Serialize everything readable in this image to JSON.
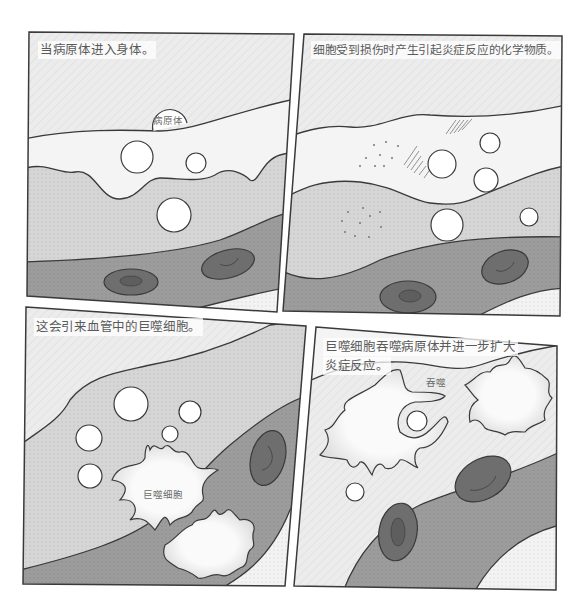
{
  "comic": {
    "panels": [
      {
        "id": 1,
        "caption": "当病原体进入身体。",
        "labels": {
          "pathogen": "病原体"
        }
      },
      {
        "id": 2,
        "caption": "细胞受到损伤时产生引起炎症反应的化学物质。",
        "labels": {}
      },
      {
        "id": 3,
        "caption": "这会引来血管中的巨噬细胞。",
        "labels": {
          "macrophage": "巨噬细胞"
        }
      },
      {
        "id": 4,
        "caption_line1": "巨噬细胞吞噬病原体并进一步扩大",
        "caption_line2": "炎症反应。",
        "labels": {
          "engulf": "吞噬"
        }
      }
    ]
  },
  "colors": {
    "page_bg": "#ffffff",
    "outline": "#3a3a3a",
    "upper_tissue": "#ececec",
    "epidermis": "#f4f4f4",
    "dermis": "#d4d4d4",
    "vessel": "#9c9c9c",
    "red_cell": "#6e6e6e",
    "red_cell_core": "#5a5a5a",
    "macrophage": "#f6f6f6",
    "pathogen": "#ffffff",
    "caption_text": "#5a5a5a"
  }
}
